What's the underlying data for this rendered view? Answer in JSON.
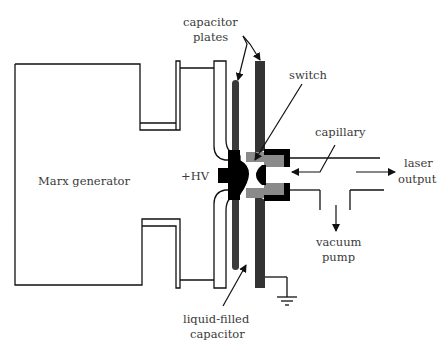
{
  "diagram": {
    "type": "schematic",
    "labels": {
      "capacitor_plates_line1": "capacitor",
      "capacitor_plates_line2": "plates",
      "switch": "switch",
      "capillary": "capillary",
      "laser_output_line1": "laser",
      "laser_output_line2": "output",
      "vacuum_pump_line1": "vacuum",
      "vacuum_pump_line2": "pump",
      "marx_generator": "Marx generator",
      "hv": "+HV",
      "liquid_capacitor_line1": "liquid-filled",
      "liquid_capacitor_line2": "capacitor"
    },
    "colors": {
      "line": "#111111",
      "plate_dark": "#3a3a3a",
      "plate_medium": "#4a4a4a",
      "capillary_gray": "#8a8a8a",
      "text": "#3a3a3a"
    }
  }
}
